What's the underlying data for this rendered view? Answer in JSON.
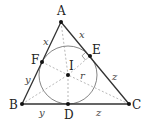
{
  "diagram": {
    "points": {
      "A": {
        "label": "A",
        "x": 61,
        "y": 22
      },
      "B": {
        "label": "B",
        "x": 22,
        "y": 104
      },
      "C": {
        "label": "C",
        "x": 129,
        "y": 104
      },
      "D": {
        "label": "D",
        "x": 68,
        "y": 104
      },
      "E": {
        "label": "E",
        "x": 90,
        "y": 56
      },
      "F": {
        "label": "F",
        "x": 42,
        "y": 62
      },
      "I": {
        "label": "I",
        "x": 68,
        "y": 75
      }
    },
    "incircle": {
      "center": "I",
      "radius": 29,
      "radius_label": "r"
    },
    "segment_labels": {
      "AF": "x",
      "AE": "x",
      "BF": "y",
      "BD": "y",
      "CE": "z",
      "CD": "z"
    },
    "colors": {
      "stroke": "#333333",
      "dashed": "#888888",
      "text": "#222222"
    }
  }
}
